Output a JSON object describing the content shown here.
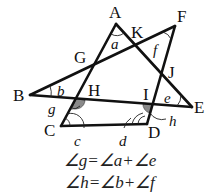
{
  "figure": {
    "points": {
      "A": "A",
      "B": "B",
      "C": "C",
      "D": "D",
      "E": "E",
      "F": "F",
      "G": "G",
      "H": "H",
      "I": "I",
      "J": "J",
      "K": "K"
    },
    "angles": {
      "a": "a",
      "b": "b",
      "c": "c",
      "d": "d",
      "e": "e",
      "f": "f",
      "g": "g",
      "h": "h"
    },
    "segments": [
      "AC",
      "AE",
      "BF",
      "BE",
      "FD",
      "CD"
    ],
    "shaded_angles": [
      "g",
      "h"
    ],
    "line_color": "#111111",
    "shade_color": "#8a8a8a"
  },
  "equations": [
    "∠g=∠a+∠e",
    "∠h=∠b+∠f"
  ]
}
